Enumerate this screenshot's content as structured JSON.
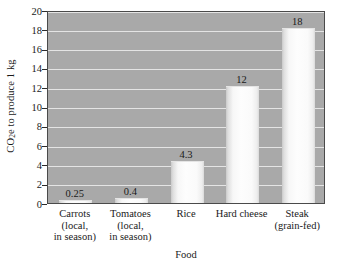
{
  "chart_data": {
    "type": "bar",
    "title": "",
    "xlabel": "Food",
    "ylabel_prefix": "CO",
    "ylabel_sub": "2",
    "ylabel_suffix": "e to produce 1 kg",
    "ylabel_full": "CO2e to produce 1 kg",
    "categories": [
      "Carrots\n(local,\nin season)",
      "Tomatoes\n(local,\nin season)",
      "Rice",
      "Hard cheese",
      "Steak\n(grain-fed)"
    ],
    "category_lines": [
      [
        "Carrots",
        "(local,",
        "in season)"
      ],
      [
        "Tomatoes",
        "(local,",
        "in season)"
      ],
      [
        "Rice"
      ],
      [
        "Hard cheese"
      ],
      [
        "Steak",
        "(grain-fed)"
      ]
    ],
    "values": [
      0.25,
      0.4,
      4.3,
      12,
      18
    ],
    "value_labels": [
      "0.25",
      "0.4",
      "4.3",
      "12",
      "18"
    ],
    "ylim": [
      0,
      20
    ],
    "ytick_labels": [
      "0",
      "2",
      "4",
      "6",
      "8",
      "10",
      "12",
      "14",
      "16",
      "18",
      "20"
    ],
    "ytick_values": [
      0,
      2,
      4,
      6,
      8,
      10,
      12,
      14,
      16,
      18,
      20
    ],
    "grid": true,
    "legend": "none",
    "colors": {
      "plot_background": "#a9a9a9",
      "gridline": "#e9e9e9",
      "bar_fill": "#f8f8f8",
      "bar_edge": "#c9c9c9",
      "axis": "#2b2b2b",
      "text": "#1a1a1a",
      "page_background": "#ffffff"
    }
  }
}
